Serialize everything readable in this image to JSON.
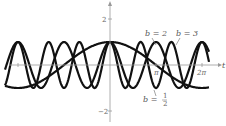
{
  "chart_data": {
    "type": "line",
    "title": "",
    "xlabel": "t",
    "ylabel": "",
    "function": "y = cos(b t)",
    "xlim": [
      -6.9,
      7.1
    ],
    "ylim": [
      -2.3,
      2.7
    ],
    "x_ticks": [
      {
        "value": -6.283,
        "label": ""
      },
      {
        "value": 3.1416,
        "label": "π"
      },
      {
        "value": 6.2832,
        "label": "2π"
      }
    ],
    "y_ticks": [
      {
        "value": 2,
        "label": "2"
      },
      {
        "value": -2,
        "label": "−2"
      }
    ],
    "series": [
      {
        "name": "b = 1/2",
        "b": 0.5,
        "label_main": "b =",
        "label_frac_num": "1",
        "label_frac_den": "2"
      },
      {
        "name": "b = 2",
        "b": 2,
        "label_main": "b = 2"
      },
      {
        "name": "b = 3",
        "b": 3,
        "label_main": "b = 3"
      }
    ],
    "grid": false,
    "legend": "none"
  }
}
